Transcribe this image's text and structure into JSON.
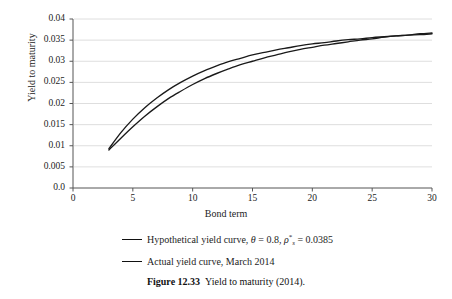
{
  "chart_data": {
    "type": "line",
    "title": "",
    "xlabel": "Bond term",
    "ylabel": "Yield to maturity",
    "xlim": [
      0,
      30
    ],
    "ylim": [
      0,
      0.04
    ],
    "grid": true,
    "grid_axis": "y",
    "legend_position": "below-axis",
    "xticks": [
      "0",
      "5",
      "10",
      "15",
      "20",
      "25",
      "30"
    ],
    "xtick_values": [
      0,
      5,
      10,
      15,
      20,
      25,
      30
    ],
    "yticks": [
      "0.0",
      "0.005",
      "0.01",
      "0.015",
      "0.02",
      "0.025",
      "0.03",
      "0.035",
      "0.04"
    ],
    "ytick_values": [
      0,
      0.005,
      0.01,
      0.015,
      0.02,
      0.025,
      0.03,
      0.035,
      0.04
    ],
    "x": [
      3,
      4,
      5,
      6,
      7,
      8,
      9,
      10,
      11,
      12,
      13,
      14,
      15,
      16,
      17,
      18,
      19,
      20,
      21,
      22,
      23,
      24,
      25,
      26,
      27,
      28,
      29,
      30
    ],
    "series": [
      {
        "name": "Hypothetical yield curve, θ = 0.8, ρ*s = 0.0385",
        "color": "#1a1a1a",
        "values": [
          0.0093,
          0.0131,
          0.0163,
          0.019,
          0.0213,
          0.0233,
          0.025,
          0.0265,
          0.0278,
          0.0289,
          0.0299,
          0.0307,
          0.0315,
          0.0321,
          0.0327,
          0.0332,
          0.0337,
          0.0341,
          0.0344,
          0.0348,
          0.0351,
          0.0353,
          0.0356,
          0.0358,
          0.036,
          0.0362,
          0.0363,
          0.0365
        ]
      },
      {
        "name": "Actual yield curve, March 2014",
        "color": "#1a1a1a",
        "values": [
          0.009,
          0.0118,
          0.0145,
          0.017,
          0.0192,
          0.0212,
          0.0229,
          0.0245,
          0.0259,
          0.0271,
          0.0282,
          0.0292,
          0.03,
          0.0308,
          0.0315,
          0.0322,
          0.0328,
          0.0333,
          0.0338,
          0.0342,
          0.0346,
          0.035,
          0.0353,
          0.0357,
          0.036,
          0.0362,
          0.0365,
          0.0367
        ]
      }
    ]
  },
  "legend": {
    "items": [
      {
        "prefix": "Hypothetical yield curve, ",
        "theta_symbol": "θ",
        "theta_eq": " = 0.8, ",
        "rho_symbol": "ρ",
        "rho_sub": "s",
        "rho_sup": "*",
        "rho_eq": " = 0.0385"
      },
      {
        "label": "Actual yield curve, March 2014"
      }
    ]
  },
  "caption": {
    "label": "Figure 12.33",
    "text": "Yield to maturity (2014)."
  }
}
